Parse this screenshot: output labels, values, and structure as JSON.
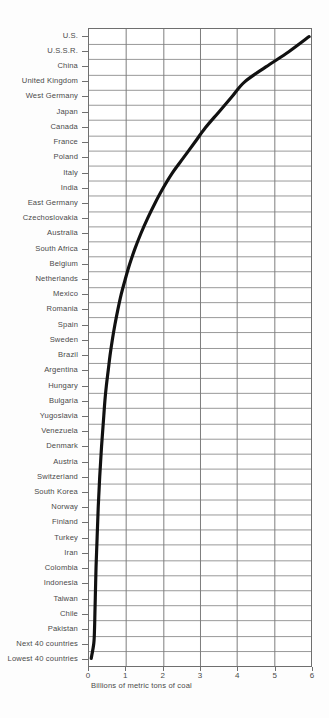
{
  "chart_data": {
    "type": "line",
    "title": "",
    "xlabel": "Billions of metric tons of coal",
    "ylabel": "",
    "orientation": "horizontal-categories",
    "grid": true,
    "legend": null,
    "xlim": [
      0,
      6
    ],
    "xticks": [
      0,
      1,
      2,
      3,
      4,
      5,
      6
    ],
    "xtick_labels": [
      "0",
      "1",
      "2",
      "3",
      "4",
      "5",
      "6"
    ],
    "categories": [
      "U.S.",
      "U.S.S.R.",
      "China",
      "United Kingdom",
      "West Germany",
      "Japan",
      "Canada",
      "France",
      "Poland",
      "Italy",
      "India",
      "East Germany",
      "Czechoslovakia",
      "Australia",
      "South Africa",
      "Belgium",
      "Netherlands",
      "Mexico",
      "Romania",
      "Spain",
      "Sweden",
      "Brazil",
      "Argentina",
      "Hungary",
      "Bulgaria",
      "Yugoslavia",
      "Venezuela",
      "Denmark",
      "Austria",
      "Switzerland",
      "South Korea",
      "Norway",
      "Finland",
      "Turkey",
      "Iran",
      "Colombia",
      "Indonesia",
      "Taiwan",
      "Chile",
      "Pakistan",
      "Next 40 countries",
      "Lowest 40 countries"
    ],
    "values": [
      5.95,
      5.4,
      4.78,
      4.2,
      3.85,
      3.5,
      3.15,
      2.85,
      2.55,
      2.25,
      2.0,
      1.78,
      1.58,
      1.4,
      1.24,
      1.1,
      0.98,
      0.87,
      0.78,
      0.7,
      0.63,
      0.57,
      0.52,
      0.47,
      0.43,
      0.4,
      0.37,
      0.34,
      0.315,
      0.29,
      0.27,
      0.25,
      0.235,
      0.22,
      0.205,
      0.19,
      0.18,
      0.17,
      0.16,
      0.15,
      0.13,
      0.06
    ]
  }
}
